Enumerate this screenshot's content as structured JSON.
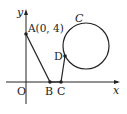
{
  "labels": {
    "y_axis": "y",
    "x_axis": "x",
    "origin": "O",
    "point_a": "A(0, 4)",
    "point_b": "B",
    "point_c": "C",
    "point_d": "D",
    "circle": "C"
  },
  "colors": {
    "stroke": "#222222",
    "background": "#ffffff"
  }
}
